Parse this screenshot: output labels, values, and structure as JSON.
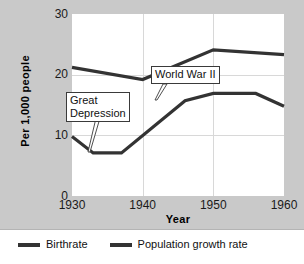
{
  "chart_data": {
    "type": "line",
    "title": "",
    "xlabel": "Year",
    "ylabel": "Per 1,000 people",
    "xlim": [
      1930,
      1960
    ],
    "ylim": [
      0,
      30
    ],
    "xticks": [
      "1930",
      "1940",
      "1950",
      "1960"
    ],
    "yticks": [
      "0",
      "10",
      "20",
      "30"
    ],
    "grid": "both",
    "legend_position": "bottom",
    "series": [
      {
        "name": "Birthrate",
        "color": "#333333",
        "x": [
          1930,
          1940,
          1950,
          1960
        ],
        "values": [
          21.2,
          19.2,
          24.1,
          23.3
        ]
      },
      {
        "name": "Population growth rate",
        "color": "#333333",
        "x": [
          1930,
          1933,
          1937,
          1946,
          1950,
          1956,
          1960
        ],
        "values": [
          9.8,
          7.1,
          7.1,
          15.7,
          16.9,
          16.9,
          14.8
        ]
      }
    ],
    "annotations": [
      {
        "label": "Great Depression",
        "lines": [
          "Great",
          "Depression"
        ],
        "points_to_year": 1934,
        "points_to_value": 7.1
      },
      {
        "label": "World War II",
        "lines": [
          "World War II"
        ],
        "points_to_year": 1944,
        "points_to_value": 14.2
      }
    ]
  },
  "axes": {
    "y_title": "Per 1,000 people",
    "x_title": "Year",
    "y_ticks": [
      "30",
      "20",
      "10",
      "0"
    ],
    "x_ticks": [
      "1930",
      "1940",
      "1950",
      "1960"
    ]
  },
  "legend": {
    "items": [
      {
        "label": "Birthrate",
        "color": "#333333"
      },
      {
        "label": "Population growth rate",
        "color": "#333333"
      }
    ]
  },
  "annotations": {
    "great_depression_line1": "Great",
    "great_depression_line2": "Depression",
    "world_war_ii": "World War II"
  }
}
